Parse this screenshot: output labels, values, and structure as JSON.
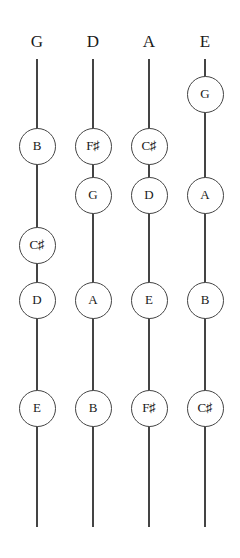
{
  "diagram": {
    "strings": [
      {
        "name": "G",
        "x": 37
      },
      {
        "name": "D",
        "x": 93
      },
      {
        "name": "A",
        "x": 149
      },
      {
        "name": "E",
        "x": 205
      }
    ],
    "notes": [
      {
        "string": "E",
        "label": "G",
        "x": 205,
        "y": 94
      },
      {
        "string": "G",
        "label": "B",
        "x": 37,
        "y": 146
      },
      {
        "string": "D",
        "label": "F♯",
        "x": 93,
        "y": 146
      },
      {
        "string": "A",
        "label": "C♯",
        "x": 149,
        "y": 146
      },
      {
        "string": "D",
        "label": "G",
        "x": 93,
        "y": 195
      },
      {
        "string": "A",
        "label": "D",
        "x": 149,
        "y": 195
      },
      {
        "string": "E",
        "label": "A",
        "x": 205,
        "y": 195
      },
      {
        "string": "G",
        "label": "C♯",
        "x": 37,
        "y": 245
      },
      {
        "string": "G",
        "label": "D",
        "x": 37,
        "y": 300
      },
      {
        "string": "D",
        "label": "A",
        "x": 93,
        "y": 300
      },
      {
        "string": "A",
        "label": "E",
        "x": 149,
        "y": 300
      },
      {
        "string": "E",
        "label": "B",
        "x": 205,
        "y": 300
      },
      {
        "string": "G",
        "label": "E",
        "x": 37,
        "y": 408
      },
      {
        "string": "D",
        "label": "B",
        "x": 93,
        "y": 408
      },
      {
        "string": "A",
        "label": "F♯",
        "x": 149,
        "y": 408
      },
      {
        "string": "E",
        "label": "C♯",
        "x": 205,
        "y": 408
      }
    ],
    "colors": {
      "line": "#444444",
      "text": "#1a1a1a",
      "background": "#ffffff"
    }
  }
}
